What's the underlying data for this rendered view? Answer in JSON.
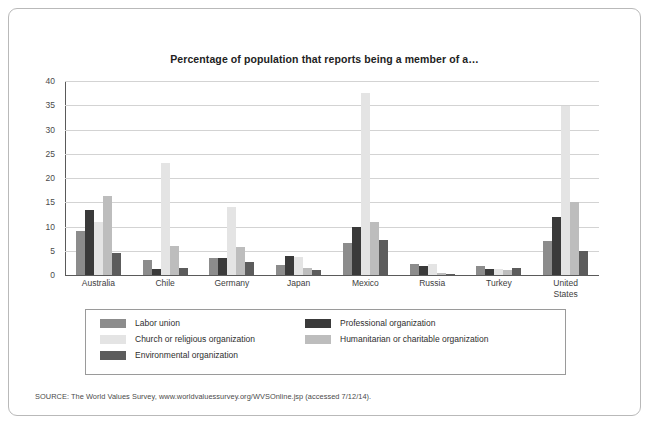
{
  "figure": {
    "title": "Percentage of population that reports being a member of a…",
    "source": "SOURCE: The World Values Survey, www.worldvaluessurvey.org/WVSOnline.jsp (accessed 7/12/14)."
  },
  "legend": {
    "left": [
      {
        "label": "Labor union",
        "color": "#8c8c8c"
      },
      {
        "label": "Church or religious organization",
        "color": "#e4e4e4"
      },
      {
        "label": "Environmental organization",
        "color": "#5c5c5c"
      }
    ],
    "right": [
      {
        "label": "Professional organization",
        "color": "#3a3a3a"
      },
      {
        "label": "Humanitarian or charitable organization",
        "color": "#bdbdbd"
      }
    ]
  },
  "chart_data": {
    "type": "bar",
    "title": "Percentage of population that reports being a member of a…",
    "xlabel": "",
    "ylabel": "",
    "ylim": [
      0,
      40
    ],
    "yticks": [
      0,
      5,
      10,
      15,
      20,
      25,
      30,
      35,
      40
    ],
    "grid": true,
    "legend_position": "bottom",
    "categories": [
      "Australia",
      "Chile",
      "Germany",
      "Japan",
      "Mexico",
      "Russia",
      "Turkey",
      "United\nStates"
    ],
    "category_labels": [
      [
        "Australia"
      ],
      [
        "Chile"
      ],
      [
        "Germany"
      ],
      [
        "Japan"
      ],
      [
        "Mexico"
      ],
      [
        "Russia"
      ],
      [
        "Turkey"
      ],
      [
        "United",
        "States"
      ]
    ],
    "series": [
      {
        "name": "Labor union",
        "color": "#8c8c8c",
        "values": [
          9.0,
          3.0,
          3.5,
          2.0,
          6.5,
          2.2,
          1.8,
          7.0
        ]
      },
      {
        "name": "Professional organization",
        "color": "#3a3a3a",
        "values": [
          13.5,
          1.3,
          3.5,
          4.0,
          10.0,
          1.8,
          1.3,
          12.0
        ]
      },
      {
        "name": "Church or religious organization",
        "color": "#e4e4e4",
        "values": [
          11.0,
          23.0,
          14.0,
          3.8,
          37.5,
          2.2,
          1.2,
          34.8
        ]
      },
      {
        "name": "Humanitarian or charitable organization",
        "color": "#bdbdbd",
        "values": [
          16.3,
          6.0,
          5.7,
          1.5,
          11.0,
          0.5,
          1.0,
          15.0
        ]
      },
      {
        "name": "Environmental organization",
        "color": "#5c5c5c",
        "values": [
          4.5,
          1.5,
          2.6,
          1.0,
          7.3,
          0.3,
          1.5,
          5.0
        ]
      }
    ]
  }
}
